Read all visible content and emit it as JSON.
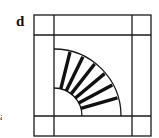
{
  "panel": {
    "label": "d",
    "edge_fragment": "a"
  },
  "diagram": {
    "type": "quilt-block-fan",
    "stroke_color": "#1a1a1a",
    "background": "#ffffff",
    "outer_square": {
      "x": 34,
      "y": 15,
      "width": 117,
      "height": 121
    },
    "grid_lines": {
      "vertical": [
        54,
        132
      ],
      "horizontal": [
        35,
        116
      ]
    },
    "fan": {
      "center": [
        54,
        116
      ],
      "outer_radius": 67,
      "inner_radius": 28,
      "blade_count": 6,
      "blade_angles_deg": [
        76,
        64,
        52,
        40,
        28,
        16
      ]
    }
  }
}
